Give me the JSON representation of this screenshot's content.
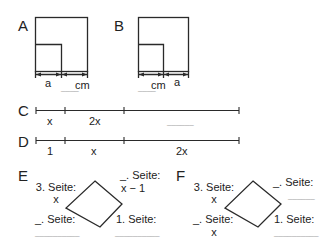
{
  "figures": {
    "A": {
      "label": "A",
      "left_label": "a",
      "right_label": "cm",
      "right_blank": "____"
    },
    "B": {
      "label": "B",
      "left_label": "cm",
      "left_blank": "____",
      "right_label": "a"
    },
    "C": {
      "label": "C",
      "segments": [
        "x",
        "2x",
        "______"
      ]
    },
    "D": {
      "label": "D",
      "segments": [
        "1",
        "x",
        "2x"
      ]
    },
    "E": {
      "label": "E",
      "top_left": {
        "title": "3. Seite:",
        "value": "x"
      },
      "top_right": {
        "title": "_. Seite:",
        "value": "x − 1"
      },
      "bottom_left": {
        "title": "_. Seite:",
        "value": "__________"
      },
      "bottom_right": {
        "title": "1. Seite:",
        "value": "__________"
      }
    },
    "F": {
      "label": "F",
      "top_left": {
        "title": "3. Seite:",
        "value": "x"
      },
      "top_right": {
        "title": "_. Seite:",
        "value": "______"
      },
      "bottom_left": {
        "title": "_. Seite:",
        "value": "x"
      },
      "bottom_right": {
        "title": "1. Seite:",
        "value": "__________"
      }
    }
  },
  "colors": {
    "stroke": "#2a2a2a",
    "text": "#222222"
  }
}
